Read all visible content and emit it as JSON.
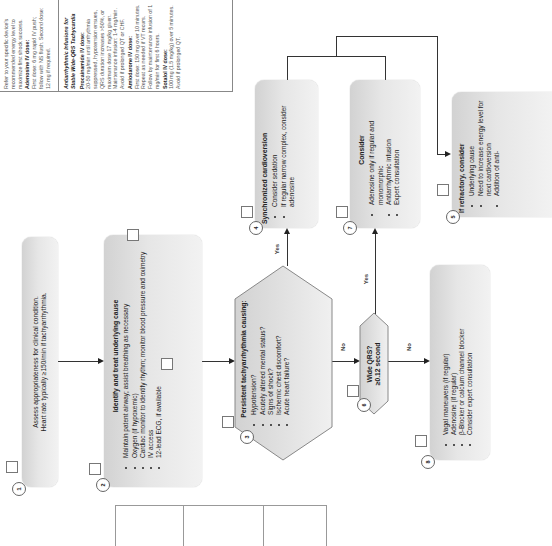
{
  "orientation": "rotated-90-ccw",
  "info_panel": {
    "section1": {
      "intro": "Refer to your specific device's recommended energy level to maximize first shock success.",
      "adenosine_title": "Adenosine IV dose:",
      "adenosine_text": "First dose: 6 mg rapid IV push; follow with NS flush. Second dose: 12 mg if required."
    },
    "section2": {
      "title": "Antiarrhythmic Infusions for Stable Wide-QRS Tachycardia",
      "procainamide_title": "Procainamide IV dose:",
      "procainamide_text": "20-50 mg/min until arrhythmia suppressed, hypotension ensues, QRS duration increases >50%, or maximum dose 17 mg/kg given. Maintenance infusion: 1-4 mg/min. Avoid if prolonged QT or CHF.",
      "amiodarone_title": "Amiodarone IV dose:",
      "amiodarone_text": "First dose: 150 mg over 10 minutes. Repeat as needed if VT recurs. Follow by maintenance infusion of 1 mg/min for first 6 hours.",
      "sotalol_title": "Sotalol IV dose:",
      "sotalol_text": "100 mg (1.5 mg/kg) over 5 minutes. Avoid if prolonged QT."
    }
  },
  "nodes": {
    "n1": {
      "number": "1",
      "lines": [
        "Assess appropriateness for clinical condition.",
        "Heart rate typically ≥150/min if tachyarrhythmia."
      ]
    },
    "n2": {
      "number": "2",
      "title": "Identify and treat underlying cause",
      "bullets": [
        "Maintain patent airway; assist breathing as necessary",
        "Oxygen (if hypoxemic)",
        "Cardiac monitor to identify rhythm; monitor blood pressure and oximetry",
        "IV access",
        "12-lead ECG, if available"
      ]
    },
    "n3": {
      "number": "3",
      "title": "Persistent tachyarrhythmia causing:",
      "bullets": [
        "Hypotension?",
        "Acutely altered mental status?",
        "Signs of shock?",
        "Ischemic chest discomfort?",
        "Acute heart failure?"
      ]
    },
    "n4": {
      "number": "4",
      "title": "Synchronized cardioversion",
      "bullets": [
        "Consider sedation",
        "If regular narrow complex, consider adenosine"
      ]
    },
    "n5": {
      "number": "5",
      "title": "If refractory, consider",
      "bullets": [
        "Underlying cause",
        "Need to increase energy level for next cardioversion",
        "Addition of anti-"
      ]
    },
    "n6": {
      "number": "6",
      "title": "Wide QRS?",
      "subtitle": "≥0.12 second"
    },
    "n7": {
      "number": "7",
      "title": "Consider",
      "bullets": [
        "Adenosine only if regular and monomorphic",
        "Antiarrhythmic infusion",
        "Expert consultation"
      ]
    },
    "n8": {
      "number": "8",
      "bullets": [
        "Vagal maneuvers (if regular)",
        "Adenosine (if regular)",
        "β-Blocker or calcium channel blocker",
        "Consider expert consultation"
      ]
    }
  },
  "edge_labels": {
    "n3_yes": "Yes",
    "n3_no": "No",
    "n6_yes": "Yes",
    "n6_no": "No"
  },
  "colors": {
    "box_dark": "#d2d2d2",
    "box_light": "#f2f2f2",
    "line": "#333333",
    "text": "#222222"
  }
}
